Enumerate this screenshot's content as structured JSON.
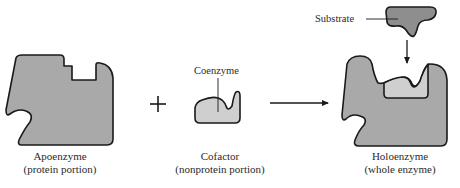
{
  "diagram": {
    "apoenzyme": {
      "name": "Apoenzyme",
      "description": "(protein portion)"
    },
    "operator_plus": "+",
    "cofactor": {
      "name": "Cofactor",
      "description": "(nonprotein portion)",
      "callout": "Coenzyme"
    },
    "holoenzyme": {
      "name": "Holoenzyme",
      "description": "(whole enzyme)"
    },
    "substrate": {
      "callout": "Substrate"
    },
    "colors": {
      "protein_fill": "#a9a9a9",
      "coenzyme_fill": "#cfcfcf",
      "substrate_fill": "#8e8e8e",
      "outline": "#1a1a1a"
    }
  }
}
